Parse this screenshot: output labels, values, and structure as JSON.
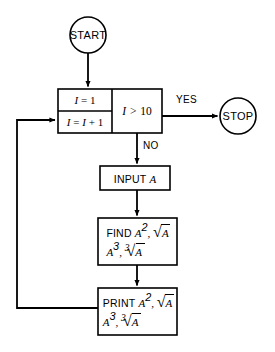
{
  "diagram": {
    "background_color": "#ffffff",
    "stroke_color": "#000000"
  },
  "nodes": {
    "start": {
      "shape": "circle",
      "label": "START",
      "cx": 88,
      "cy": 35,
      "r": 18
    },
    "init": {
      "shape": "process",
      "label_plain": "I = 1",
      "var": "I",
      "op": "=",
      "value": "1"
    },
    "increment": {
      "shape": "process",
      "label_plain": "I = I + 1",
      "var": "I",
      "op": "=",
      "expr_var": "I",
      "expr_op": "+",
      "expr_value": "1"
    },
    "decision": {
      "shape": "decision-box",
      "label_plain": "I > 10",
      "var": "I",
      "op": ">",
      "value": "10"
    },
    "stop": {
      "shape": "circle",
      "label": "STOP",
      "cx": 238,
      "cy": 116,
      "r": 18
    },
    "input": {
      "shape": "process",
      "keyword": "INPUT",
      "operand": "A",
      "label_plain": "INPUT A"
    },
    "find": {
      "shape": "process",
      "keyword": "FIND",
      "line1_plain": "FIND A2, √A",
      "line2_plain": "A3, ∛ A",
      "operand": "A",
      "exp_square": "2",
      "exp_cube": "3",
      "root_index": "3"
    },
    "print": {
      "shape": "process",
      "keyword": "PRINT",
      "line1_plain": "PRINT A2, √A",
      "line2_plain": "A3, ∛ A",
      "operand": "A",
      "exp_square": "2",
      "exp_cube": "3",
      "root_index": "3"
    }
  },
  "edges": {
    "yes_label": "YES",
    "no_label": "NO",
    "loop_description": "feedback from PRINT back to I = I + 1"
  }
}
